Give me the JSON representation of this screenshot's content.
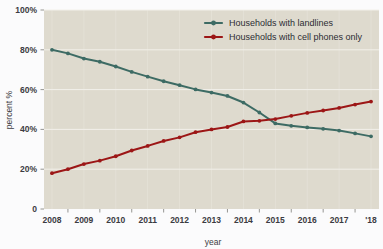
{
  "chart_data": {
    "type": "line",
    "title": "",
    "xlabel": "year",
    "ylabel": "percent %",
    "ylim": [
      0,
      100
    ],
    "xlim": [
      2007.75,
      2018.25
    ],
    "grid": true,
    "legend_position": "top-right",
    "ytick_labels": [
      "100%",
      "80%",
      "60%",
      "40%",
      "20%",
      "0"
    ],
    "ytick_values": [
      100,
      80,
      60,
      40,
      20,
      0
    ],
    "xtick_labels": [
      "2008",
      "2009",
      "2010",
      "2011",
      "2012",
      "2013",
      "2014",
      "2015",
      "2016",
      "2017",
      "'18"
    ],
    "xtick_values": [
      2008,
      2009,
      2010,
      2011,
      2012,
      2013,
      2014,
      2015,
      2016,
      2017,
      2018
    ],
    "x": [
      2008,
      2008.5,
      2009,
      2009.5,
      2010,
      2010.5,
      2011,
      2011.5,
      2012,
      2012.5,
      2013,
      2013.5,
      2014,
      2014.5,
      2015,
      2015.5,
      2016,
      2016.5,
      2017,
      2017.5,
      2018
    ],
    "series": [
      {
        "name": "Households with landlines",
        "color": "#3d6b64",
        "values": [
          80.0,
          78.2,
          75.6,
          74.0,
          71.6,
          68.9,
          66.5,
          64.2,
          62.2,
          60.1,
          58.5,
          56.8,
          53.5,
          48.5,
          43.0,
          41.8,
          41.0,
          40.3,
          39.4,
          38.0,
          36.5
        ]
      },
      {
        "name": "Households with cell phones only",
        "color": "#9c1616",
        "values": [
          18.0,
          20.0,
          22.6,
          24.3,
          26.5,
          29.4,
          31.7,
          34.2,
          36.0,
          38.6,
          40.0,
          41.2,
          44.0,
          44.3,
          45.2,
          46.8,
          48.3,
          49.5,
          50.8,
          52.5,
          54.0
        ]
      }
    ]
  },
  "legend": {
    "entries": [
      {
        "label": "Households with landlines"
      },
      {
        "label": "Households with cell phones only"
      }
    ]
  },
  "colors": {
    "plot_background": "#dedace",
    "page_background": "#fbfbfc",
    "gridline": "#f2f0ea",
    "axis_text": "#3b3b42",
    "series_landline": "#3d6b64",
    "series_cellonly": "#9c1616"
  }
}
